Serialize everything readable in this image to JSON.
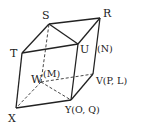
{
  "diagram": {
    "type": "parallelepiped",
    "vertices": {
      "S": {
        "x": 49,
        "y": 24,
        "label": "S"
      },
      "R": {
        "x": 100,
        "y": 18,
        "label": "R"
      },
      "T": {
        "x": 22,
        "y": 53,
        "label": "T"
      },
      "U": {
        "x": 78,
        "y": 44,
        "label": "U"
      },
      "W": {
        "x": 41,
        "y": 82,
        "label": "W"
      },
      "V": {
        "x": 93,
        "y": 74,
        "label": "V"
      },
      "X": {
        "x": 16,
        "y": 108,
        "label": "X"
      },
      "Y": {
        "x": 71,
        "y": 100,
        "label": "Y"
      }
    },
    "labels": {
      "S": "S",
      "R": "R",
      "T": "T",
      "U": "U",
      "N": "(N)",
      "W": "W",
      "M": "(M)",
      "V": "V(P, L)",
      "X": "X",
      "Y": "Y(O, Q)"
    },
    "solid_edges": [
      [
        "S",
        "R"
      ],
      [
        "S",
        "T"
      ],
      [
        "S",
        "U"
      ],
      [
        "T",
        "U"
      ],
      [
        "U",
        "R"
      ],
      [
        "R",
        "V"
      ],
      [
        "V",
        "Y"
      ],
      [
        "U",
        "Y"
      ],
      [
        "T",
        "X"
      ],
      [
        "X",
        "Y"
      ]
    ],
    "dashed_edges": [
      [
        "W",
        "S"
      ],
      [
        "W",
        "X"
      ],
      [
        "W",
        "Y"
      ],
      [
        "W",
        "V"
      ]
    ]
  }
}
